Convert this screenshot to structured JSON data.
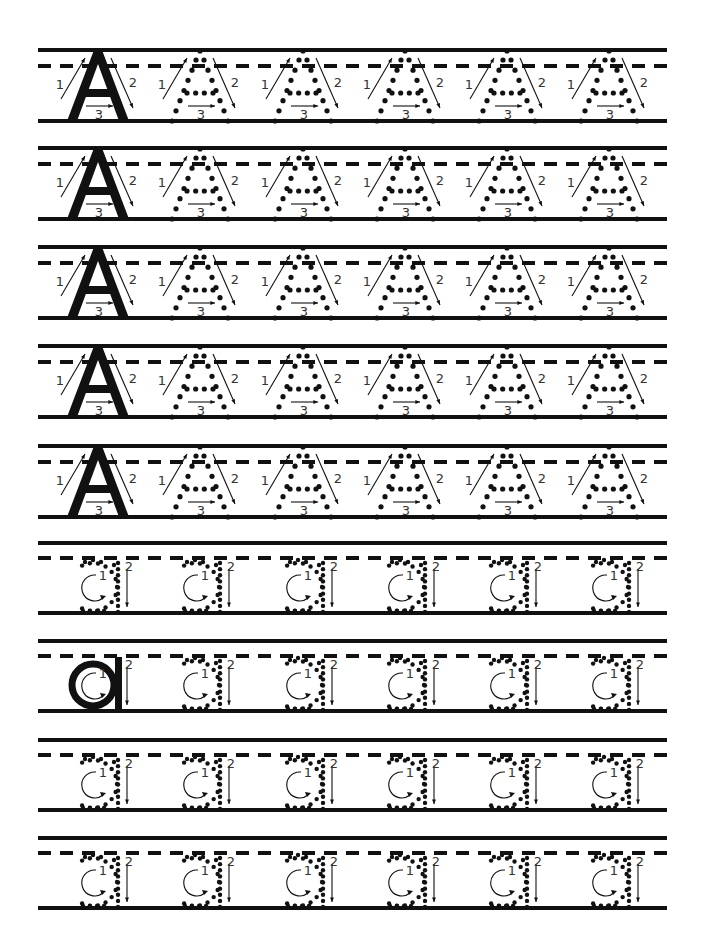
{
  "worksheet": {
    "title": "Letter A handwriting practice",
    "ink_color": "#111111",
    "page": {
      "line_left": 38,
      "line_right": 667
    },
    "letter_centers": [
      98,
      200,
      303,
      405,
      507,
      609
    ],
    "stroke_labels": {
      "uppercase": [
        "1",
        "2",
        "3"
      ],
      "lowercase": [
        "1",
        "2"
      ]
    },
    "rows": [
      {
        "top": 50,
        "letter": "A",
        "case": "uppercase",
        "model_first": true
      },
      {
        "top": 148,
        "letter": "A",
        "case": "uppercase",
        "model_first": true
      },
      {
        "top": 247,
        "letter": "A",
        "case": "uppercase",
        "model_first": true
      },
      {
        "top": 346,
        "letter": "A",
        "case": "uppercase",
        "model_first": true
      },
      {
        "top": 446,
        "letter": "A",
        "case": "uppercase",
        "model_first": true
      },
      {
        "top": 543,
        "letter": "a",
        "case": "lowercase",
        "model_first": false
      },
      {
        "top": 641,
        "letter": "a",
        "case": "lowercase",
        "model_first": true
      },
      {
        "top": 740,
        "letter": "a",
        "case": "lowercase",
        "model_first": false
      },
      {
        "top": 838,
        "letter": "a",
        "case": "lowercase",
        "model_first": false
      }
    ]
  }
}
